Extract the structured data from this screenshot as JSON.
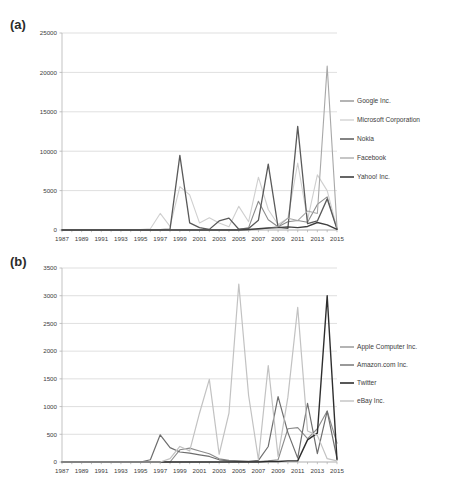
{
  "figures": [
    {
      "panel_label": "(a)",
      "chart_data": {
        "type": "line",
        "title": "",
        "xlabel": "",
        "ylabel": "",
        "ylim": [
          0,
          25000
        ],
        "ytick_step": 5000,
        "yticks": [
          "0",
          "5000",
          "10000",
          "15000",
          "20000",
          "25000"
        ],
        "grid": true,
        "legend_position": "right",
        "x": [
          1987,
          1988,
          1989,
          1990,
          1991,
          1992,
          1993,
          1994,
          1995,
          1996,
          1997,
          1998,
          1999,
          2000,
          2001,
          2002,
          2003,
          2004,
          2005,
          2006,
          2007,
          2008,
          2009,
          2010,
          2011,
          2012,
          2013,
          2014,
          2015
        ],
        "xticks": [
          "1987",
          "1989",
          "1991",
          "1993",
          "1995",
          "1997",
          "1999",
          "2001",
          "2003",
          "2005",
          "2007",
          "2009",
          "2011",
          "2013",
          "2015"
        ],
        "series": [
          {
            "name": "Google Inc.",
            "color": "#8c8c8c",
            "width": 1.1,
            "values": [
              0,
              0,
              0,
              0,
              0,
              0,
              0,
              0,
              0,
              0,
              0,
              0,
              0,
              0,
              0,
              0,
              0,
              0,
              60,
              300,
              3650,
              1300,
              420,
              1050,
              1200,
              980,
              3250,
              4200,
              150
            ]
          },
          {
            "name": "Microsoft Corporation",
            "color": "#cfcfcf",
            "width": 1.1,
            "values": [
              0,
              0,
              0,
              0,
              0,
              0,
              0,
              30,
              60,
              160,
              2100,
              450,
              5500,
              4450,
              900,
              1550,
              900,
              400,
              3000,
              1050,
              6700,
              2600,
              700,
              1500,
              8500,
              1300,
              7000,
              5000,
              200
            ]
          },
          {
            "name": "Nokia",
            "color": "#5a5a5a",
            "width": 1.3,
            "values": [
              0,
              0,
              0,
              0,
              0,
              0,
              0,
              0,
              0,
              0,
              60,
              120,
              9480,
              900,
              300,
              80,
              1150,
              1500,
              100,
              200,
              1250,
              8350,
              350,
              200,
              13150,
              800,
              1150,
              3950,
              120
            ]
          },
          {
            "name": "Facebook",
            "color": "#a8a8a8",
            "width": 1.1,
            "values": [
              0,
              0,
              0,
              0,
              0,
              0,
              0,
              0,
              0,
              0,
              0,
              0,
              0,
              0,
              0,
              0,
              0,
              0,
              0,
              0,
              100,
              250,
              450,
              1500,
              1200,
              2400,
              2100,
              20800,
              300
            ]
          },
          {
            "name": "Yahoo! Inc.",
            "color": "#3f3f3f",
            "width": 1.4,
            "values": [
              0,
              0,
              0,
              0,
              0,
              0,
              0,
              0,
              0,
              0,
              0,
              0,
              0,
              0,
              0,
              0,
              0,
              0,
              0,
              60,
              150,
              250,
              300,
              400,
              300,
              450,
              950,
              650,
              80
            ]
          }
        ]
      }
    },
    {
      "panel_label": "(b)",
      "chart_data": {
        "type": "line",
        "title": "",
        "xlabel": "",
        "ylabel": "",
        "ylim": [
          0,
          3500
        ],
        "ytick_step": 500,
        "yticks": [
          "0",
          "500",
          "1000",
          "1500",
          "2000",
          "2500",
          "3000",
          "3500"
        ],
        "grid": true,
        "legend_position": "right",
        "x": [
          1987,
          1988,
          1989,
          1990,
          1991,
          1992,
          1993,
          1994,
          1995,
          1996,
          1997,
          1998,
          1999,
          2000,
          2001,
          2002,
          2003,
          2004,
          2005,
          2006,
          2007,
          2008,
          2009,
          2010,
          2011,
          2012,
          2013,
          2014,
          2015
        ],
        "xticks": [
          "1987",
          "1989",
          "1991",
          "1993",
          "1995",
          "1997",
          "1999",
          "2001",
          "2003",
          "2005",
          "2007",
          "2009",
          "2011",
          "2013",
          "2015"
        ],
        "series": [
          {
            "name": "Apple Computer Inc.",
            "color": "#8c8c8c",
            "width": 1.1,
            "values": [
              0,
              0,
              0,
              0,
              0,
              0,
              0,
              0,
              0,
              0,
              0,
              0,
              220,
              250,
              200,
              150,
              60,
              30,
              20,
              10,
              10,
              20,
              40,
              600,
              620,
              420,
              600,
              920,
              340
            ]
          },
          {
            "name": "Amazon.com Inc.",
            "color": "#6e6e6e",
            "width": 1.2,
            "values": [
              0,
              0,
              0,
              0,
              0,
              0,
              0,
              0,
              0,
              40,
              490,
              260,
              180,
              160,
              130,
              100,
              40,
              20,
              10,
              10,
              30,
              280,
              1180,
              530,
              70,
              1060,
              150,
              920,
              60
            ]
          },
          {
            "name": "Twitter",
            "color": "#2e2e2e",
            "width": 1.4,
            "values": [
              0,
              0,
              0,
              0,
              0,
              0,
              0,
              0,
              0,
              0,
              0,
              0,
              0,
              0,
              0,
              0,
              0,
              0,
              0,
              0,
              0,
              10,
              10,
              20,
              20,
              400,
              520,
              3000,
              40
            ]
          },
          {
            "name": "eBay Inc.",
            "color": "#c2c2c2",
            "width": 1.2,
            "values": [
              0,
              0,
              0,
              0,
              0,
              0,
              0,
              0,
              0,
              0,
              0,
              60,
              280,
              200,
              880,
              1490,
              140,
              880,
              3210,
              1200,
              40,
              1740,
              100,
              1170,
              2790,
              560,
              480,
              60,
              20
            ]
          }
        ]
      }
    }
  ]
}
